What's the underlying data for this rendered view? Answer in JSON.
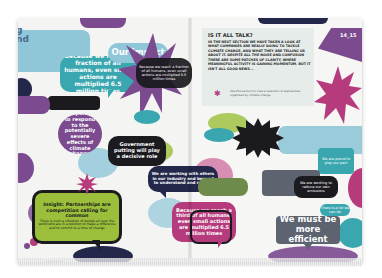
{
  "spread": {
    "page_number": "14_15",
    "heading_fragment": [
      "g",
      "nd"
    ],
    "folio_text": "www.site.com"
  },
  "info_box": {
    "title": "IS IT ALL TALK?",
    "body": "In the next section we have taken a look at what companies are really doing to tackle climate change, and what they are telling us about it. Despite all the noise and confusion there are some patches of clarity, where meaningful activity is gaining momentum. But it isn't all good news...",
    "note": "Use this section to view a selection of approaches, organised by climate change",
    "note_icon": "bug-icon"
  },
  "bubbles": {
    "human_reach": "Because we reach a fraction of all humans, even small actions are multiplied 6.5 million times",
    "preparing": "preparing to respond to the potentially severe effects of climate change",
    "government": "Government putting will play a decisive role",
    "working_with": "We are working with others in our industry and beyond to understand and reduce",
    "partnerships": "Insight: Partnerships are competition calling for common",
    "partnerships_body": "There is such a vibration of people all over the world who are in a position to make a difference and to commit to a time of change",
    "small_actions": "Because we reach a third of all humans, even small actions are multiplied 6.5 million times",
    "efficient_line1": "We must be",
    "efficient_line2": "more efficient",
    "upper_center": "Our impact",
    "right_star": "We believe our products can make a real difference to the climate",
    "right_teal": "We are proud to play our part",
    "right_dark": "We are working to reduce our own emissions",
    "right_small": "There is a lot we can do"
  },
  "colors": {
    "teal": "#3aa7b0",
    "purple": "#7b4a8f",
    "magenta": "#b63b7d",
    "navy": "#23284a",
    "lime": "#9bbf3a",
    "lightblue": "#8fc6d8",
    "olive": "#6f8b4c",
    "grey": "#5d6470",
    "pink": "#d27aa6",
    "black": "#1a1a1f"
  }
}
